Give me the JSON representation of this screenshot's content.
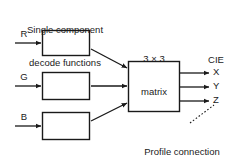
{
  "diagram": {
    "title": "Single component\ndecode functions",
    "title_line1": "Single component",
    "title_line2": "decode functions",
    "inputs": [
      {
        "label": "R",
        "name": "input-r"
      },
      {
        "label": "G",
        "name": "input-g"
      },
      {
        "label": "B",
        "name": "input-b"
      }
    ],
    "decode_boxes": [
      {
        "label": "",
        "name": "decode-box-r"
      },
      {
        "label": "",
        "name": "decode-box-g"
      },
      {
        "label": "",
        "name": "decode-box-b"
      }
    ],
    "matrix": {
      "caption_line1": "3 × 3",
      "caption_line2": "matrix",
      "label": ""
    },
    "outputs_header": "CIE",
    "outputs": [
      {
        "label": "X",
        "name": "output-x"
      },
      {
        "label": "Y",
        "name": "output-y"
      },
      {
        "label": "Z",
        "name": "output-z"
      }
    ],
    "annotation": {
      "line1": "Profile connection",
      "line2": "space (PCS)"
    },
    "colors": {
      "stroke": "#1a1a1a",
      "background": "#ffffff",
      "text": "#1a1a1a"
    }
  }
}
